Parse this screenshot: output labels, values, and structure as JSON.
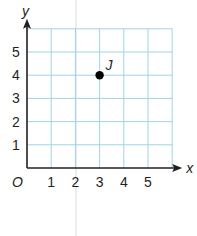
{
  "chart_data": {
    "type": "scatter",
    "title": "",
    "xlabel": "x",
    "ylabel": "y",
    "origin_label": "O",
    "xlim": [
      0,
      6
    ],
    "ylim": [
      0,
      6
    ],
    "grid": true,
    "x_ticks": [
      "1",
      "2",
      "3",
      "4",
      "5"
    ],
    "y_ticks": [
      "1",
      "2",
      "3",
      "4",
      "5"
    ],
    "points": [
      {
        "label": "J",
        "x": 3,
        "y": 4
      }
    ],
    "colors": {
      "grid": "#9fd3e6",
      "axis": "#231f20",
      "point": "#000000"
    }
  }
}
